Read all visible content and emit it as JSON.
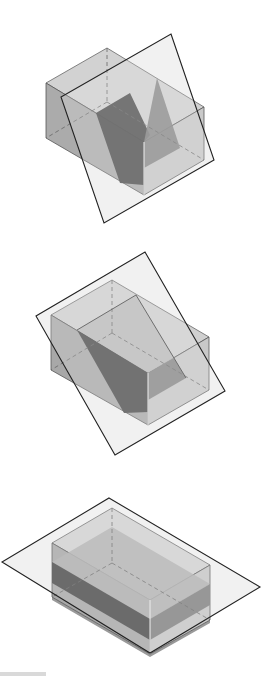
{
  "diagram": {
    "colors": {
      "background": "#ffffff",
      "plane_fill": "#f2f2f2",
      "plane_stroke": "#222222",
      "box_top": "#d4d4d4",
      "box_left": "#a9a9a9",
      "box_right": "#c8c8c8",
      "section_dark": "#4a4a4a",
      "section_mid": "#7a7a7a",
      "edge": "#555555",
      "hidden_edge": "#666666"
    },
    "figures": [
      {
        "id": "figure-1",
        "label": "Oblique plane cutting box (steep)",
        "plane": [
          [
            171,
            34
          ],
          [
            214,
            160
          ],
          [
            104,
            223
          ],
          [
            61,
            97
          ]
        ],
        "box": {
          "top": [
            [
              46,
              83
            ],
            [
              107,
              48
            ],
            [
              204,
              107
            ],
            [
              144,
              142
            ]
          ],
          "left": [
            [
              46,
              83
            ],
            [
              144,
              142
            ],
            [
              144,
              195
            ],
            [
              46,
              138
            ]
          ],
          "right": [
            [
              144,
              142
            ],
            [
              204,
              107
            ],
            [
              204,
              160
            ],
            [
              144,
              195
            ]
          ],
          "hidden": [
            [
              [
                107,
                48
              ],
              [
                107,
                102
              ]
            ],
            [
              [
                107,
                102
              ],
              [
                46,
                138
              ]
            ],
            [
              [
                107,
                102
              ],
              [
                204,
                160
              ]
            ]
          ]
        },
        "section": [
          [
            96,
            113
          ],
          [
            157,
            78
          ],
          [
            180,
            148
          ],
          [
            119,
            183
          ]
        ],
        "section_inner": [
          [
            157,
            78
          ],
          [
            180,
            148
          ],
          [
            144,
            168
          ],
          [
            144,
            142
          ]
        ]
      },
      {
        "id": "figure-2",
        "label": "Oblique plane cutting box (shallower)",
        "plane": [
          [
            145,
            252
          ],
          [
            225,
            391
          ],
          [
            115,
            455
          ],
          [
            36,
            316
          ]
        ],
        "box": {
          "top": [
            [
              51,
              315
            ],
            [
              112,
              280
            ],
            [
              209,
              337
            ],
            [
              148,
              373
            ]
          ],
          "left": [
            [
              51,
              315
            ],
            [
              148,
              373
            ],
            [
              148,
              425
            ],
            [
              51,
              370
            ]
          ],
          "right": [
            [
              148,
              373
            ],
            [
              209,
              337
            ],
            [
              209,
              390
            ],
            [
              148,
              425
            ]
          ],
          "hidden": [
            [
              [
                112,
                280
              ],
              [
                112,
                333
              ]
            ],
            [
              [
                112,
                333
              ],
              [
                51,
                370
              ]
            ],
            [
              [
                112,
                333
              ],
              [
                209,
                390
              ]
            ]
          ]
        },
        "section": [
          [
            77,
            330
          ],
          [
            136,
            295
          ],
          [
            186,
            378
          ],
          [
            124,
            413
          ]
        ],
        "section_inner": [
          [
            136,
            295
          ],
          [
            186,
            378
          ],
          [
            148,
            400
          ],
          [
            148,
            373
          ]
        ]
      },
      {
        "id": "figure-3",
        "label": "Horizontal plane cutting box",
        "plane": [
          [
            109,
            498
          ],
          [
            260,
            587
          ],
          [
            150,
            653
          ],
          [
            2,
            562
          ]
        ],
        "box": {
          "top": [
            [
              52,
              543
            ],
            [
              112,
              508
            ],
            [
              210,
              565
            ],
            [
              150,
              600
            ]
          ],
          "left": [
            [
              52,
              543
            ],
            [
              150,
              600
            ],
            [
              150,
              654
            ],
            [
              52,
              597
            ]
          ],
          "right": [
            [
              150,
              600
            ],
            [
              210,
              565
            ],
            [
              210,
              620
            ],
            [
              150,
              654
            ]
          ],
          "hidden": [
            [
              [
                112,
                508
              ],
              [
                112,
                563
              ]
            ],
            [
              [
                112,
                563
              ],
              [
                52,
                597
              ]
            ],
            [
              [
                112,
                563
              ],
              [
                210,
                620
              ]
            ]
          ]
        },
        "section": [
          [
            52,
            562
          ],
          [
            150,
            619
          ],
          [
            150,
            640
          ],
          [
            52,
            583
          ]
        ],
        "section_inner": [
          [
            150,
            619
          ],
          [
            210,
            584
          ],
          [
            210,
            605
          ],
          [
            150,
            640
          ]
        ]
      }
    ]
  }
}
